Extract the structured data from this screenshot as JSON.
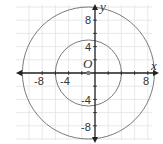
{
  "diagram": {
    "type": "coordinate-plane-circles",
    "axes": {
      "x_label": "x",
      "y_label": "y",
      "x_ticks": [
        "-8",
        "-4",
        "8"
      ],
      "y_ticks": [
        "8",
        "4",
        "-4",
        "-8"
      ],
      "range": [
        -10,
        10
      ]
    },
    "point": {
      "label": "O",
      "x": -1,
      "y": 0
    },
    "circles": [
      {
        "name": "inner",
        "cx": -1,
        "cy": 0,
        "r": 5
      },
      {
        "name": "outer",
        "cx": -1,
        "cy": 0,
        "r": 10
      }
    ],
    "colors": {
      "grid": "#e2e2e2",
      "axis": "#222222",
      "circle": "#7a7a7a",
      "point": "#808080"
    }
  }
}
